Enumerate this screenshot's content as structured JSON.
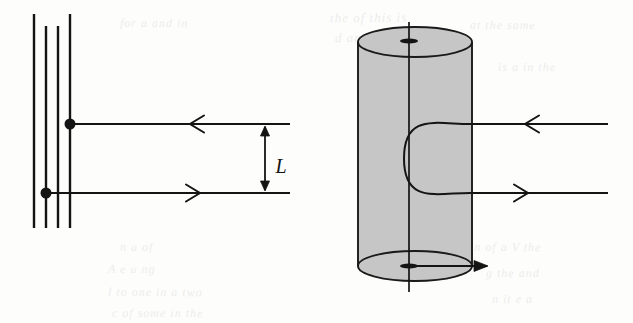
{
  "figure": {
    "name": "magnetic-field-lines-and-cylinder-diagram",
    "background_color": "#fdfdfc",
    "ink_color": "#141414",
    "cylinder_fill_color": "#c6c6c6",
    "cylinder_stroke_color": "#1a1a1a",
    "labels": {
      "separation_label": "L"
    },
    "left_panel": {
      "name": "parallel-lines-panel",
      "vertical_lines": [
        {
          "x": 34,
          "y_top": 14,
          "y_bottom": 228
        },
        {
          "x": 46,
          "y_top": 26,
          "y_bottom": 228
        },
        {
          "x": 58,
          "y_top": 26,
          "y_bottom": 228
        },
        {
          "x": 70,
          "y_top": 14,
          "y_bottom": 228
        }
      ],
      "dots": [
        {
          "name": "upper-node-dot",
          "cx": 70,
          "cy": 124,
          "r": 5.5
        },
        {
          "name": "lower-node-dot",
          "cx": 46,
          "cy": 193,
          "r": 5.5
        }
      ],
      "rays": [
        {
          "name": "upper-ray-leftward",
          "x_start": 70,
          "x_end": 290,
          "y": 124,
          "arrow_direction": "left",
          "arrow_x": 190
        },
        {
          "name": "lower-ray-rightward",
          "x_start": 46,
          "x_end": 290,
          "y": 193,
          "arrow_direction": "right",
          "arrow_x": 200
        }
      ],
      "dimension_arrow": {
        "name": "separation-dimension-L",
        "x": 265,
        "y_top": 124,
        "y_bottom": 193,
        "label": "L",
        "label_x": 281,
        "label_y": 166
      }
    },
    "right_panel": {
      "name": "cylinder-panel",
      "cylinder": {
        "name": "solenoid-cylinder",
        "cx": 415,
        "left_x": 358,
        "right_x": 472,
        "top_center_y": 42,
        "bottom_center_y": 266,
        "ellipse_rx": 57,
        "ellipse_ry": 15
      },
      "axis_line": {
        "name": "cylinder-axis",
        "x": 409,
        "y_top": 22,
        "y_bottom": 292
      },
      "end_marks": [
        {
          "name": "top-center-mark",
          "cx": 409,
          "cy": 41,
          "rx": 9,
          "ry": 2.6
        },
        {
          "name": "bottom-center-mark",
          "cx": 409,
          "cy": 266,
          "rx": 9,
          "ry": 2.6
        }
      ],
      "field_loop": {
        "name": "u-turn-field-line",
        "upper_y": 124,
        "lower_y": 193,
        "turn_left_x": 404,
        "attach_x": 470,
        "x_end": 608
      },
      "rays": [
        {
          "name": "upper-ray-leftward",
          "x_start": 470,
          "x_end": 608,
          "y": 124,
          "arrow_direction": "left",
          "arrow_x": 525
        },
        {
          "name": "lower-ray-rightward",
          "x_start": 470,
          "x_end": 608,
          "y": 193,
          "arrow_direction": "right",
          "arrow_x": 528
        },
        {
          "name": "bottom-outflow-arrow",
          "x_start": 409,
          "x_end": 487,
          "y": 266,
          "arrow_direction": "right",
          "arrow_x": 487
        }
      ]
    },
    "bleed_through_text": [
      {
        "text": "the  of  this  is",
        "x": 330,
        "y": 10,
        "size": 13,
        "rotate": -0.6
      },
      {
        "text": "d  and  a",
        "x": 335,
        "y": 30,
        "size": 13,
        "rotate": -0.4
      },
      {
        "text": "for  a  and  in",
        "x": 120,
        "y": 16,
        "size": 12,
        "rotate": 0.4
      },
      {
        "text": "at  the  same",
        "x": 470,
        "y": 18,
        "size": 12,
        "rotate": 0.3
      },
      {
        "text": "is  a  in  the",
        "x": 498,
        "y": 60,
        "size": 12,
        "rotate": 0.2
      },
      {
        "text": "n  a  of",
        "x": 120,
        "y": 240,
        "size": 12,
        "rotate": 0.5
      },
      {
        "text": "A  e  u  ng",
        "x": 108,
        "y": 262,
        "size": 12,
        "rotate": 0.4
      },
      {
        "text": "l  to  one  in  a  two",
        "x": 108,
        "y": 285,
        "size": 12,
        "rotate": 0.3
      },
      {
        "text": "c  of  some  in  the",
        "x": 112,
        "y": 306,
        "size": 12,
        "rotate": 0.2
      },
      {
        "text": "in  of  a  V  the",
        "x": 470,
        "y": 240,
        "size": 12,
        "rotate": 0.3
      },
      {
        "text": "g  the  and",
        "x": 486,
        "y": 266,
        "size": 12,
        "rotate": 0.2
      },
      {
        "text": "n  it  e  a",
        "x": 492,
        "y": 292,
        "size": 12,
        "rotate": 0.3
      }
    ]
  }
}
